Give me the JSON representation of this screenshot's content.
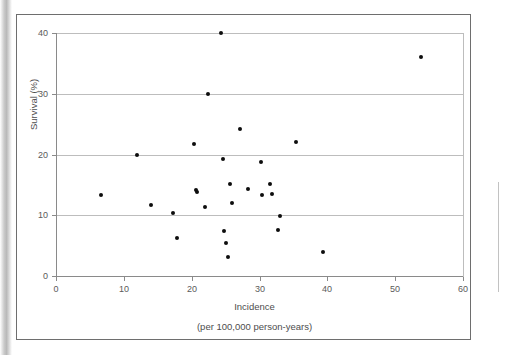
{
  "chart_data": {
    "type": "scatter",
    "title": "",
    "xlabel": "Incidence",
    "xsublabel": "(per 100,000 person-years)",
    "ylabel": "Survival (%)",
    "xlim": [
      0,
      60
    ],
    "ylim": [
      0,
      40
    ],
    "xticks": [
      0,
      10,
      20,
      30,
      40,
      50,
      60
    ],
    "yticks": [
      0,
      10,
      20,
      30,
      40
    ],
    "xtick_labels": [
      "0",
      "10",
      "20",
      "30",
      "40",
      "50",
      "60"
    ],
    "ytick_labels": [
      "0",
      "10",
      "20",
      "30",
      "40"
    ],
    "grid": "horizontal",
    "legend": "none",
    "marker_color": "#0d0d0d",
    "gridline_color": "#bdbdbd",
    "axis_color": "#8a8a8a",
    "points": [
      {
        "x": 6.6,
        "y": 13.4
      },
      {
        "x": 11.9,
        "y": 20.0
      },
      {
        "x": 14.0,
        "y": 11.7
      },
      {
        "x": 17.2,
        "y": 10.4
      },
      {
        "x": 17.8,
        "y": 6.3
      },
      {
        "x": 20.4,
        "y": 21.7
      },
      {
        "x": 20.6,
        "y": 14.2
      },
      {
        "x": 20.8,
        "y": 13.9
      },
      {
        "x": 22.0,
        "y": 11.3
      },
      {
        "x": 22.4,
        "y": 30.0
      },
      {
        "x": 24.3,
        "y": 40.0
      },
      {
        "x": 24.6,
        "y": 19.2
      },
      {
        "x": 24.7,
        "y": 7.4
      },
      {
        "x": 25.1,
        "y": 5.5
      },
      {
        "x": 25.3,
        "y": 3.2
      },
      {
        "x": 25.6,
        "y": 15.2
      },
      {
        "x": 25.9,
        "y": 12.0
      },
      {
        "x": 27.1,
        "y": 24.2
      },
      {
        "x": 28.3,
        "y": 14.3
      },
      {
        "x": 30.2,
        "y": 18.8
      },
      {
        "x": 30.4,
        "y": 13.4
      },
      {
        "x": 31.5,
        "y": 15.2
      },
      {
        "x": 31.9,
        "y": 13.5
      },
      {
        "x": 32.8,
        "y": 7.5
      },
      {
        "x": 33.0,
        "y": 9.8
      },
      {
        "x": 35.4,
        "y": 22.1
      },
      {
        "x": 39.4,
        "y": 4.0
      },
      {
        "x": 53.8,
        "y": 36.1
      }
    ]
  }
}
